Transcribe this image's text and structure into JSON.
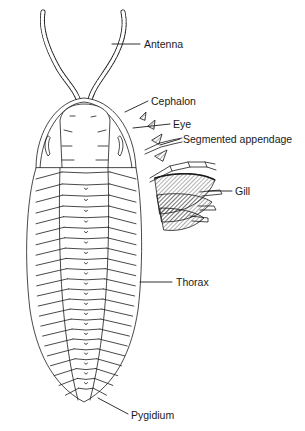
{
  "diagram": {
    "stroke_color": "#1a1a1a",
    "background": "#ffffff",
    "labels": [
      {
        "id": "antenna",
        "text": "Antenna",
        "x": 144,
        "y": 40
      },
      {
        "id": "cephalon",
        "text": "Cephalon",
        "x": 151,
        "y": 97
      },
      {
        "id": "eye",
        "text": "Eye",
        "x": 173,
        "y": 120
      },
      {
        "id": "segmented-appendage",
        "text": "Segmented appendage",
        "x": 183,
        "y": 135
      },
      {
        "id": "gill",
        "text": "Gill",
        "x": 235,
        "y": 187
      },
      {
        "id": "thorax",
        "text": "Thorax",
        "x": 176,
        "y": 278
      },
      {
        "id": "pygidium",
        "text": "Pygidium",
        "x": 132,
        "y": 411
      }
    ]
  }
}
